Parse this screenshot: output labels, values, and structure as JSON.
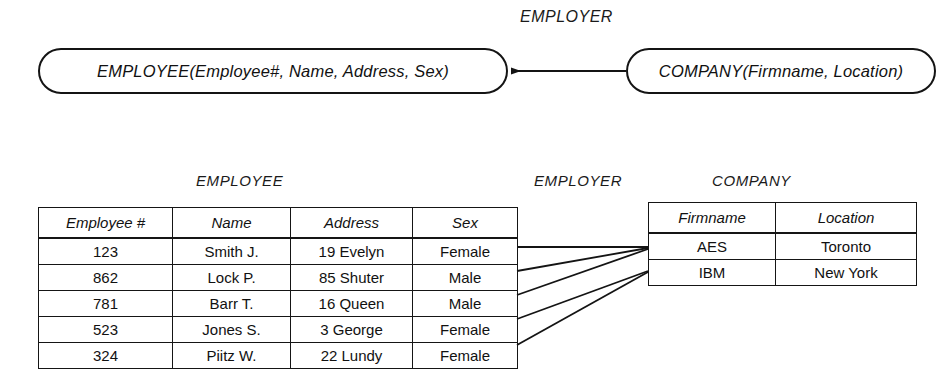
{
  "schema": {
    "relationship_label": "EMPLOYER",
    "employee_entity": "EMPLOYEE(Employee#, Name, Address, Sex)",
    "company_entity": "COMPANY(Firmname, Location)",
    "arrow_direction": "company-to-employee"
  },
  "instance": {
    "employee_title": "EMPLOYEE",
    "relationship_title": "EMPLOYER",
    "company_title": "COMPANY",
    "employee_table": {
      "columns": [
        "Employee #",
        "Name",
        "Address",
        "Sex"
      ],
      "rows": [
        [
          "123",
          "Smith J.",
          "19 Evelyn",
          "Female"
        ],
        [
          "862",
          "Lock P.",
          "85 Shuter",
          "Male"
        ],
        [
          "781",
          "Barr T.",
          "16 Queen",
          "Male"
        ],
        [
          "523",
          "Jones S.",
          "3 George",
          "Female"
        ],
        [
          "324",
          "Piitz W.",
          "22 Lundy",
          "Female"
        ]
      ]
    },
    "company_table": {
      "columns": [
        "Firmname",
        "Location"
      ],
      "rows": [
        [
          "AES",
          "Toronto"
        ],
        [
          "IBM",
          "New York"
        ]
      ]
    },
    "links": [
      {
        "employee": "123",
        "company": "AES"
      },
      {
        "employee": "862",
        "company": "AES"
      },
      {
        "employee": "781",
        "company": "AES"
      },
      {
        "employee": "523",
        "company": "IBM"
      },
      {
        "employee": "324",
        "company": "IBM"
      }
    ]
  },
  "colors": {
    "ink": "#141414",
    "background": "#ffffff"
  }
}
